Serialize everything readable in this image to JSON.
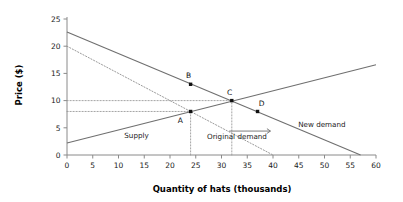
{
  "chart_data": {
    "type": "line",
    "title": "",
    "xlabel": "Quantity of hats (thousands)",
    "ylabel": "Price ($)",
    "xlim": [
      0,
      60
    ],
    "ylim": [
      0,
      25
    ],
    "xticks": [
      0,
      5,
      10,
      15,
      20,
      25,
      30,
      35,
      40,
      45,
      50,
      55,
      60
    ],
    "yticks": [
      0,
      5,
      10,
      15,
      20,
      25
    ],
    "grid": false,
    "legend": "inline-annotations",
    "series": [
      {
        "name": "Supply",
        "style": "solid",
        "label": "Supply",
        "label_x": 13.5,
        "label_y": 3.2,
        "x": [
          0,
          60
        ],
        "y": [
          2.2,
          16.6
        ]
      },
      {
        "name": "New demand",
        "style": "solid",
        "label": "New demand",
        "label_x": 49.5,
        "label_y": 5.2,
        "x": [
          0,
          57
        ],
        "y": [
          22.6,
          0
        ]
      },
      {
        "name": "Original demand",
        "style": "dotted",
        "label": "Original demand",
        "label_x": 33.0,
        "label_y": 3.0,
        "x": [
          0,
          40
        ],
        "y": [
          20.0,
          0
        ]
      }
    ],
    "points": [
      {
        "label": "A",
        "x": 24,
        "y": 8,
        "label_dx": -2.0,
        "label_dy": -1.6
      },
      {
        "label": "B",
        "x": 24,
        "y": 13,
        "label_dx": -0.4,
        "label_dy": 1.6
      },
      {
        "label": "C",
        "x": 32,
        "y": 10,
        "label_dx": -0.4,
        "label_dy": 1.5
      },
      {
        "label": "D",
        "x": 37,
        "y": 8,
        "label_dx": 0.8,
        "label_dy": 1.4
      }
    ],
    "guides": [
      {
        "name": "price-10-horizontal",
        "x1": 0,
        "y1": 10,
        "x2": 32,
        "y2": 10
      },
      {
        "name": "price-8-horizontal",
        "x1": 0,
        "y1": 8,
        "x2": 24,
        "y2": 8
      },
      {
        "name": "qty-24-vertical",
        "x1": 24,
        "y1": 0,
        "x2": 24,
        "y2": 8
      },
      {
        "name": "qty-32-vertical",
        "x1": 32,
        "y1": 0,
        "x2": 32,
        "y2": 10
      }
    ],
    "annotations": [
      {
        "name": "demand-shift-arrow",
        "type": "arrow",
        "x1": 31.5,
        "y1": 4.4,
        "x2": 39.5,
        "y2": 4.4,
        "direction": "right"
      }
    ],
    "colors": {
      "solid_line": "#6f6f6f",
      "dotted_line": "#9a9a9a",
      "axis": "#8a8a8a",
      "point": "#111111",
      "text": "#1a1a1a",
      "background": "#ffffff"
    }
  }
}
